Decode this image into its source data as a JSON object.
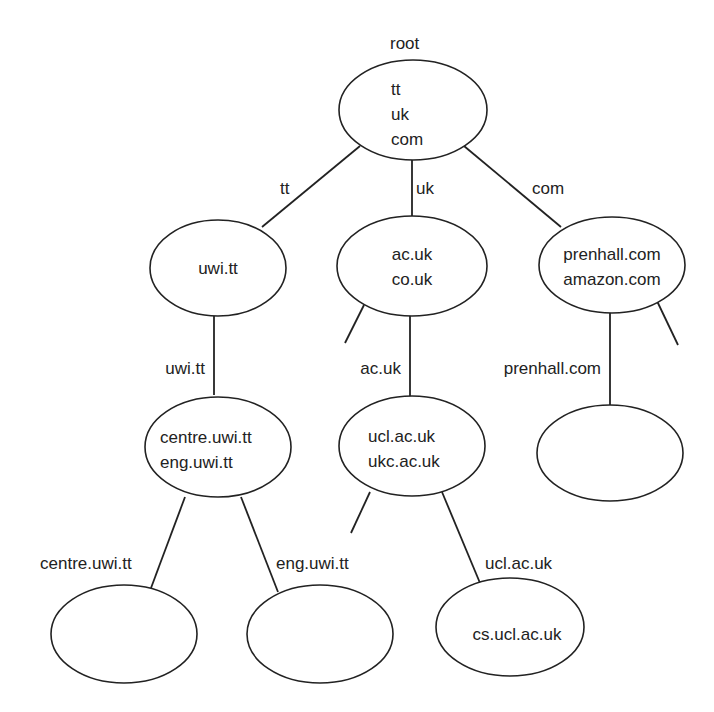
{
  "diagram": {
    "type": "name-space-tree",
    "root_caption": "root",
    "colors": {
      "stroke": "#222222",
      "text": "#222222",
      "background": "#ffffff"
    },
    "nodes": {
      "root": {
        "lines": [
          "tt",
          "uk",
          "com"
        ]
      },
      "uwi_tt": {
        "lines": [
          "uwi.tt"
        ]
      },
      "uk": {
        "lines": [
          "ac.uk",
          "co.uk"
        ]
      },
      "com": {
        "lines": [
          "prenhall.com",
          "amazon.com"
        ]
      },
      "uwi_sub": {
        "lines": [
          "centre.uwi.tt",
          "eng.uwi.tt"
        ]
      },
      "ac_uk": {
        "lines": [
          "ucl.ac.uk",
          "ukc.ac.uk"
        ]
      },
      "prenhall": {
        "lines": []
      },
      "centre": {
        "lines": []
      },
      "eng": {
        "lines": []
      },
      "ucl": {
        "lines": [
          "cs.ucl.ac.uk"
        ]
      }
    },
    "edges": {
      "root_tt": "tt",
      "root_uk": "uk",
      "root_com": "com",
      "tt_uwi": "uwi.tt",
      "uk_ac": "ac.uk",
      "com_prenhall": "prenhall.com",
      "uwi_centre": "centre.uwi.tt",
      "uwi_eng": "eng.uwi.tt",
      "ac_ucl": "ucl.ac.uk"
    }
  }
}
